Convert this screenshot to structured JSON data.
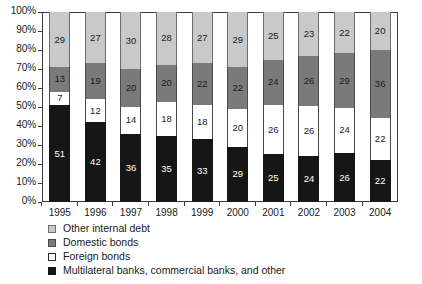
{
  "chart_data": {
    "type": "bar",
    "stacked": true,
    "normalized_percent": true,
    "title": "",
    "subtitle": "",
    "xlabel": "",
    "ylabel": "",
    "ylim": [
      0,
      100
    ],
    "grid": false,
    "legend_position": "below-left",
    "categories": [
      "1995",
      "1996",
      "1997",
      "1998",
      "1999",
      "2000",
      "2001",
      "2002",
      "2003",
      "2004"
    ],
    "y_ticks": [
      "0%",
      "10%",
      "20%",
      "30%",
      "40%",
      "50%",
      "60%",
      "70%",
      "80%",
      "90%",
      "100%"
    ],
    "series": [
      {
        "name": "Multilateral banks, commercial banks, and other",
        "color": "#161616",
        "swatch": "sw-multilateral",
        "segment_class": "seg-multilateral",
        "values": [
          51,
          42,
          36,
          35,
          33,
          29,
          25,
          24,
          26,
          22
        ]
      },
      {
        "name": "Foreign bonds",
        "color": "#ffffff",
        "swatch": "sw-foreign",
        "segment_class": "seg-foreign",
        "values": [
          7,
          12,
          14,
          18,
          18,
          20,
          26,
          26,
          24,
          22
        ]
      },
      {
        "name": "Domestic bonds",
        "color": "#7a7a7a",
        "swatch": "sw-domestic",
        "segment_class": "seg-domestic",
        "values": [
          13,
          19,
          20,
          20,
          22,
          22,
          24,
          26,
          29,
          36
        ]
      },
      {
        "name": "Other internal debt",
        "color": "#c9c9c9",
        "swatch": "sw-other-internal",
        "segment_class": "seg-other-internal",
        "values": [
          29,
          27,
          30,
          28,
          27,
          29,
          25,
          23,
          22,
          20
        ]
      }
    ],
    "legend_order": [
      "Other internal debt",
      "Domestic bonds",
      "Foreign bonds",
      "Multilateral banks, commercial banks, and other"
    ]
  },
  "legend": {
    "items": [
      {
        "label": "Other internal debt",
        "swatch": "sw-other-internal"
      },
      {
        "label": "Domestic bonds",
        "swatch": "sw-domestic"
      },
      {
        "label": "Foreign bonds",
        "swatch": "sw-foreign"
      },
      {
        "label": "Multilateral banks, commercial banks, and other",
        "swatch": "sw-multilateral"
      }
    ]
  }
}
